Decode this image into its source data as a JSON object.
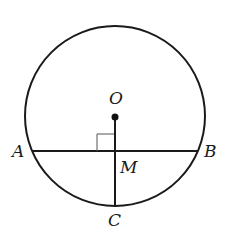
{
  "diagram": {
    "type": "circle-geometry",
    "circle": {
      "cx": 115,
      "cy": 116,
      "r": 90,
      "stroke": "#1a1a1a"
    },
    "center_point": {
      "x": 115,
      "y": 117,
      "label": "O"
    },
    "chord": {
      "from": "A",
      "to": "B",
      "x1": 32,
      "y1": 151,
      "x2": 198,
      "y2": 151
    },
    "radius_segment": {
      "from": "O",
      "to": "C",
      "x1": 115,
      "y1": 117,
      "x2": 115,
      "y2": 206
    },
    "right_angle_marker": {
      "at": "M",
      "x": 97,
      "y": 134,
      "size": 17
    },
    "labels": {
      "O": "O",
      "A": "A",
      "B": "B",
      "M": "M",
      "C": "C"
    }
  }
}
